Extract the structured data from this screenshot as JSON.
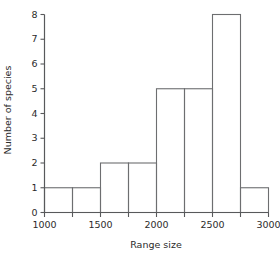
{
  "chart_data": {
    "type": "bar",
    "title": "",
    "xlabel": "Range size",
    "ylabel": "Number of species",
    "categories": [
      "1000-1250",
      "1250-1500",
      "1500-1750",
      "1750-2000",
      "2000-2250",
      "2250-2500",
      "2500-2750",
      "2750-3000"
    ],
    "bin_edges": [
      1000,
      1250,
      1500,
      1750,
      2000,
      2250,
      2500,
      2750,
      3000
    ],
    "bin_width": 250,
    "values": [
      1,
      1,
      2,
      2,
      5,
      5,
      8,
      1
    ],
    "xlim": [
      1000,
      3000
    ],
    "ylim": [
      0,
      8
    ],
    "x_tick_values": [
      1000,
      1250,
      1500,
      1750,
      2000,
      2250,
      2500,
      2750,
      3000
    ],
    "x_labeled_ticks": [
      1000,
      1500,
      2000,
      2500,
      3000
    ],
    "y_tick_values": [
      0,
      1,
      2,
      3,
      4,
      5,
      6,
      7,
      8
    ],
    "grid": false,
    "legend": false,
    "colors": {
      "bar_stroke": "#6d6e70",
      "bar_fill": "none",
      "axis": "#58595b",
      "text": "#2b2b2b",
      "background": "#ffffff"
    }
  },
  "axes": {
    "x_title": "Range size",
    "y_title": "Number of species",
    "x_tick_labels": [
      "1000",
      "1500",
      "2000",
      "2500",
      "3000"
    ],
    "y_tick_labels": [
      "0",
      "1",
      "2",
      "3",
      "4",
      "5",
      "6",
      "7",
      "8"
    ]
  }
}
